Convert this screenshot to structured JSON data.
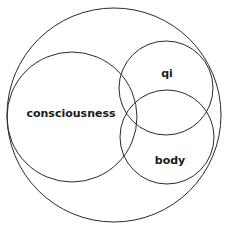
{
  "diagram": {
    "type": "venn",
    "stroke_color": "#2a2a2a",
    "circles": [
      {
        "id": "outer",
        "label": "",
        "cx": 114,
        "cy": 115,
        "r": 107
      },
      {
        "id": "consciousness",
        "label": "consciousness",
        "cx": 72,
        "cy": 117,
        "r": 65
      },
      {
        "id": "qi",
        "label": "qi",
        "cx": 166,
        "cy": 88,
        "r": 47
      },
      {
        "id": "body",
        "label": "body",
        "cx": 167,
        "cy": 137,
        "r": 47
      }
    ],
    "labels": {
      "consciousness": "consciousness",
      "qi": "qi",
      "body": "body"
    }
  }
}
